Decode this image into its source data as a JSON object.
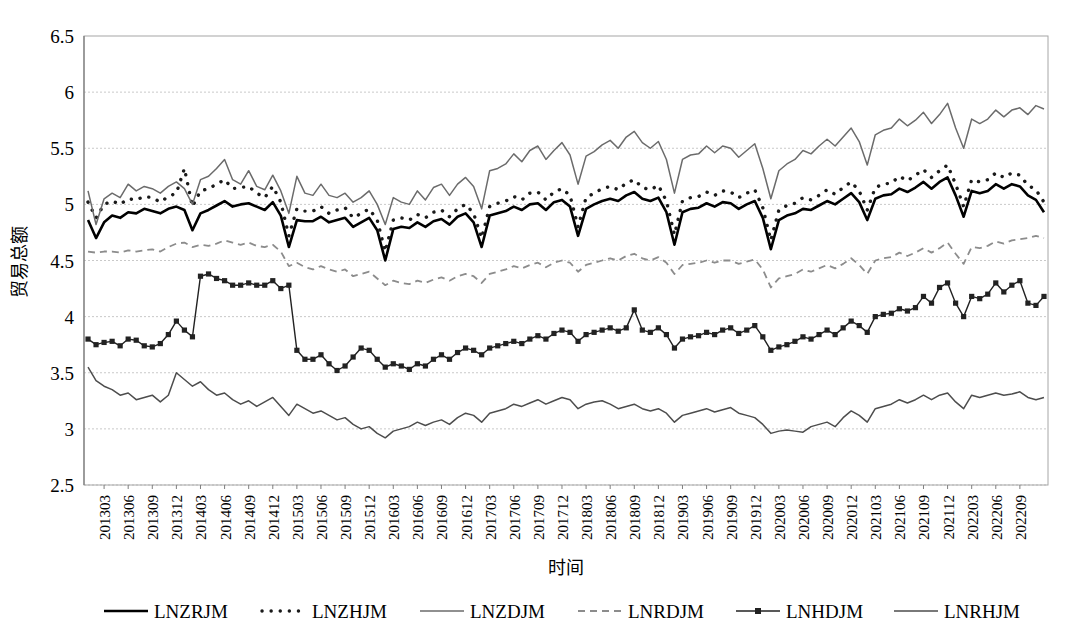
{
  "axes": {
    "y_title": "贸易总额",
    "x_title": "时间",
    "y_ticks": [
      "6.5",
      "6",
      "5.5",
      "5",
      "4.5",
      "4",
      "3.5",
      "3",
      "2.5"
    ],
    "x_ticks": [
      "201303",
      "201306",
      "201309",
      "201312",
      "201403",
      "201406",
      "201409",
      "201412",
      "201503",
      "201506",
      "201509",
      "201512",
      "201603",
      "201606",
      "201609",
      "201612",
      "201703",
      "201706",
      "201709",
      "201712",
      "201803",
      "201806",
      "201809",
      "201812",
      "201903",
      "201906",
      "201909",
      "201912",
      "202003",
      "202006",
      "202009",
      "202012",
      "202103",
      "202106",
      "202109",
      "202112",
      "202203",
      "202206",
      "202209"
    ]
  },
  "legend": {
    "items": [
      {
        "label": "LNZRJM",
        "style": "solid-thick-black",
        "color": "#000000"
      },
      {
        "label": "LNZHJM",
        "style": "dotted-black",
        "color": "#1a1a1a"
      },
      {
        "label": "LNZDJM",
        "style": "solid-thin-gray",
        "color": "#6b6b6b"
      },
      {
        "label": "LNRDJM",
        "style": "dashed-gray",
        "color": "#8c8c8c"
      },
      {
        "label": "LNHDJM",
        "style": "line-square-marker",
        "color": "#222222"
      },
      {
        "label": "LNRHJM",
        "style": "solid-thin-darkgray",
        "color": "#4d4d4d"
      }
    ]
  },
  "chart_data": {
    "type": "line",
    "title": "",
    "xlabel": "时间",
    "ylabel": "贸易总额",
    "ylim": [
      2.5,
      6.5
    ],
    "ytick_step": 0.5,
    "grid": true,
    "legend_position": "bottom",
    "x_start": "201301",
    "x_end": "202212",
    "x_frequency": "monthly",
    "x_tick_interval_months": 3,
    "x": [
      "201301",
      "201302",
      "201303",
      "201304",
      "201305",
      "201306",
      "201307",
      "201308",
      "201309",
      "201310",
      "201311",
      "201312",
      "201401",
      "201402",
      "201403",
      "201404",
      "201405",
      "201406",
      "201407",
      "201408",
      "201409",
      "201410",
      "201411",
      "201412",
      "201501",
      "201502",
      "201503",
      "201504",
      "201505",
      "201506",
      "201507",
      "201508",
      "201509",
      "201510",
      "201511",
      "201512",
      "201601",
      "201602",
      "201603",
      "201604",
      "201605",
      "201606",
      "201607",
      "201608",
      "201609",
      "201610",
      "201611",
      "201612",
      "201701",
      "201702",
      "201703",
      "201704",
      "201705",
      "201706",
      "201707",
      "201708",
      "201709",
      "201710",
      "201711",
      "201712",
      "201801",
      "201802",
      "201803",
      "201804",
      "201805",
      "201806",
      "201807",
      "201808",
      "201809",
      "201810",
      "201811",
      "201812",
      "201901",
      "201902",
      "201903",
      "201904",
      "201905",
      "201906",
      "201907",
      "201908",
      "201909",
      "201910",
      "201911",
      "201912",
      "202001",
      "202002",
      "202003",
      "202004",
      "202005",
      "202006",
      "202007",
      "202008",
      "202009",
      "202010",
      "202011",
      "202012",
      "202101",
      "202102",
      "202103",
      "202104",
      "202105",
      "202106",
      "202107",
      "202108",
      "202109",
      "202110",
      "202111",
      "202112",
      "202201",
      "202202",
      "202203",
      "202204",
      "202205",
      "202206",
      "202207",
      "202208",
      "202209",
      "202210",
      "202211",
      "202212"
    ],
    "series": [
      {
        "name": "LNZRJM",
        "style": "solid-thick-black",
        "values": [
          4.86,
          4.7,
          4.84,
          4.9,
          4.88,
          4.93,
          4.92,
          4.96,
          4.94,
          4.92,
          4.96,
          4.98,
          4.95,
          4.77,
          4.92,
          4.95,
          4.99,
          5.03,
          4.98,
          5.0,
          5.01,
          4.98,
          4.95,
          5.02,
          4.9,
          4.62,
          4.86,
          4.85,
          4.85,
          4.89,
          4.84,
          4.86,
          4.88,
          4.8,
          4.84,
          4.88,
          4.77,
          4.5,
          4.78,
          4.8,
          4.79,
          4.84,
          4.8,
          4.85,
          4.87,
          4.82,
          4.89,
          4.92,
          4.84,
          4.62,
          4.9,
          4.92,
          4.94,
          4.98,
          4.95,
          5.0,
          5.01,
          4.95,
          5.02,
          5.04,
          4.98,
          4.72,
          4.96,
          5.0,
          5.03,
          5.05,
          5.03,
          5.08,
          5.11,
          5.05,
          5.03,
          5.06,
          4.93,
          4.64,
          4.93,
          4.96,
          4.97,
          5.01,
          4.98,
          5.02,
          5.01,
          4.96,
          5.0,
          5.03,
          4.88,
          4.6,
          4.86,
          4.9,
          4.92,
          4.96,
          4.95,
          4.99,
          5.03,
          5.0,
          5.05,
          5.1,
          5.02,
          4.86,
          5.05,
          5.08,
          5.09,
          5.14,
          5.11,
          5.15,
          5.2,
          5.14,
          5.2,
          5.24,
          5.08,
          4.89,
          5.12,
          5.1,
          5.12,
          5.18,
          5.14,
          5.18,
          5.16,
          5.08,
          5.04,
          4.93
        ]
      },
      {
        "name": "LNZHJM",
        "style": "dotted-black",
        "values": [
          5.02,
          4.88,
          5.0,
          5.03,
          5.0,
          5.05,
          5.04,
          5.07,
          5.06,
          5.02,
          5.07,
          5.1,
          5.32,
          4.98,
          5.12,
          5.14,
          5.18,
          5.22,
          5.14,
          5.15,
          5.16,
          5.1,
          5.06,
          5.16,
          5.02,
          4.72,
          4.96,
          4.94,
          4.94,
          4.98,
          4.92,
          4.95,
          4.97,
          4.88,
          4.92,
          4.96,
          4.86,
          4.58,
          4.86,
          4.88,
          4.86,
          4.91,
          4.88,
          4.93,
          4.95,
          4.89,
          4.96,
          5.0,
          4.92,
          4.7,
          4.98,
          5.01,
          5.03,
          5.07,
          5.04,
          5.1,
          5.11,
          5.04,
          5.11,
          5.14,
          5.08,
          4.8,
          5.06,
          5.1,
          5.14,
          5.16,
          5.13,
          5.19,
          5.22,
          5.15,
          5.13,
          5.17,
          5.03,
          4.73,
          5.03,
          5.06,
          5.07,
          5.11,
          5.08,
          5.12,
          5.11,
          5.06,
          5.1,
          5.13,
          4.97,
          4.68,
          4.95,
          4.99,
          5.01,
          5.06,
          5.04,
          5.08,
          5.13,
          5.09,
          5.15,
          5.2,
          5.12,
          4.95,
          5.15,
          5.18,
          5.19,
          5.25,
          5.21,
          5.26,
          5.31,
          5.24,
          5.3,
          5.35,
          5.18,
          4.98,
          5.22,
          5.2,
          5.22,
          5.28,
          5.24,
          5.28,
          5.26,
          5.17,
          5.13,
          5.02
        ]
      },
      {
        "name": "LNZDJM",
        "style": "solid-thin-gray",
        "values": [
          5.12,
          4.82,
          5.05,
          5.1,
          5.06,
          5.18,
          5.12,
          5.16,
          5.14,
          5.1,
          5.16,
          5.2,
          5.14,
          5.0,
          5.22,
          5.25,
          5.32,
          5.4,
          5.22,
          5.18,
          5.3,
          5.16,
          5.13,
          5.26,
          5.12,
          4.92,
          5.25,
          5.1,
          5.08,
          5.18,
          5.08,
          5.06,
          5.1,
          5.02,
          5.06,
          5.12,
          5.0,
          4.82,
          5.06,
          5.02,
          5.0,
          5.12,
          5.04,
          5.15,
          5.18,
          5.08,
          5.18,
          5.24,
          5.16,
          4.96,
          5.3,
          5.32,
          5.36,
          5.45,
          5.38,
          5.48,
          5.52,
          5.4,
          5.48,
          5.55,
          5.44,
          5.18,
          5.43,
          5.47,
          5.53,
          5.57,
          5.5,
          5.6,
          5.65,
          5.55,
          5.5,
          5.56,
          5.4,
          5.1,
          5.4,
          5.44,
          5.45,
          5.52,
          5.46,
          5.52,
          5.5,
          5.42,
          5.48,
          5.54,
          5.32,
          5.05,
          5.3,
          5.36,
          5.4,
          5.48,
          5.45,
          5.52,
          5.58,
          5.52,
          5.6,
          5.68,
          5.56,
          5.35,
          5.62,
          5.66,
          5.68,
          5.76,
          5.7,
          5.75,
          5.82,
          5.72,
          5.8,
          5.9,
          5.68,
          5.5,
          5.76,
          5.72,
          5.76,
          5.84,
          5.78,
          5.84,
          5.86,
          5.8,
          5.88,
          5.85
        ]
      },
      {
        "name": "LNRDJM",
        "style": "dashed-gray",
        "values": [
          4.58,
          4.57,
          4.58,
          4.58,
          4.57,
          4.59,
          4.58,
          4.59,
          4.6,
          4.58,
          4.62,
          4.65,
          4.66,
          4.62,
          4.64,
          4.63,
          4.65,
          4.68,
          4.66,
          4.64,
          4.66,
          4.63,
          4.62,
          4.64,
          4.58,
          4.45,
          4.48,
          4.44,
          4.42,
          4.45,
          4.42,
          4.4,
          4.42,
          4.36,
          4.38,
          4.4,
          4.34,
          4.28,
          4.32,
          4.3,
          4.29,
          4.32,
          4.3,
          4.33,
          4.35,
          4.32,
          4.36,
          4.38,
          4.36,
          4.3,
          4.38,
          4.4,
          4.42,
          4.45,
          4.43,
          4.46,
          4.48,
          4.44,
          4.48,
          4.5,
          4.48,
          4.4,
          4.46,
          4.48,
          4.5,
          4.52,
          4.5,
          4.54,
          4.56,
          4.52,
          4.5,
          4.53,
          4.48,
          4.38,
          4.46,
          4.47,
          4.48,
          4.5,
          4.48,
          4.5,
          4.5,
          4.47,
          4.49,
          4.51,
          4.42,
          4.26,
          4.34,
          4.36,
          4.38,
          4.42,
          4.4,
          4.43,
          4.46,
          4.43,
          4.47,
          4.52,
          4.46,
          4.38,
          4.5,
          4.52,
          4.53,
          4.57,
          4.54,
          4.57,
          4.61,
          4.57,
          4.61,
          4.66,
          4.56,
          4.47,
          4.62,
          4.61,
          4.63,
          4.67,
          4.65,
          4.68,
          4.69,
          4.7,
          4.72,
          4.7
        ]
      },
      {
        "name": "LNHDJM",
        "style": "line-square-marker",
        "values": [
          3.8,
          3.75,
          3.77,
          3.78,
          3.74,
          3.8,
          3.79,
          3.74,
          3.73,
          3.76,
          3.84,
          3.96,
          3.88,
          3.82,
          4.36,
          4.38,
          4.34,
          4.32,
          4.28,
          4.28,
          4.3,
          4.28,
          4.28,
          4.32,
          4.25,
          4.28,
          3.7,
          3.62,
          3.62,
          3.66,
          3.58,
          3.52,
          3.56,
          3.64,
          3.72,
          3.7,
          3.62,
          3.55,
          3.58,
          3.56,
          3.53,
          3.58,
          3.56,
          3.62,
          3.66,
          3.62,
          3.68,
          3.72,
          3.7,
          3.66,
          3.72,
          3.74,
          3.76,
          3.78,
          3.76,
          3.8,
          3.83,
          3.8,
          3.85,
          3.88,
          3.86,
          3.78,
          3.84,
          3.86,
          3.88,
          3.9,
          3.87,
          3.9,
          4.06,
          3.88,
          3.86,
          3.9,
          3.84,
          3.72,
          3.8,
          3.82,
          3.83,
          3.86,
          3.84,
          3.88,
          3.9,
          3.85,
          3.88,
          3.92,
          3.82,
          3.7,
          3.73,
          3.75,
          3.78,
          3.82,
          3.8,
          3.84,
          3.88,
          3.84,
          3.9,
          3.96,
          3.92,
          3.86,
          4.0,
          4.02,
          4.03,
          4.07,
          4.05,
          4.08,
          4.18,
          4.12,
          4.26,
          4.3,
          4.12,
          4.0,
          4.18,
          4.16,
          4.2,
          4.3,
          4.22,
          4.28,
          4.32,
          4.12,
          4.1,
          4.18
        ]
      },
      {
        "name": "LNRHJM",
        "style": "solid-thin-darkgray",
        "values": [
          3.55,
          3.43,
          3.38,
          3.35,
          3.3,
          3.32,
          3.26,
          3.28,
          3.3,
          3.24,
          3.3,
          3.5,
          3.44,
          3.38,
          3.42,
          3.35,
          3.3,
          3.32,
          3.26,
          3.22,
          3.25,
          3.2,
          3.24,
          3.28,
          3.2,
          3.12,
          3.22,
          3.18,
          3.14,
          3.16,
          3.12,
          3.08,
          3.1,
          3.04,
          3.0,
          3.02,
          2.96,
          2.92,
          2.98,
          3.0,
          3.02,
          3.06,
          3.03,
          3.06,
          3.08,
          3.04,
          3.1,
          3.14,
          3.12,
          3.06,
          3.14,
          3.16,
          3.18,
          3.22,
          3.2,
          3.23,
          3.26,
          3.22,
          3.25,
          3.28,
          3.26,
          3.18,
          3.22,
          3.24,
          3.25,
          3.22,
          3.18,
          3.2,
          3.22,
          3.18,
          3.16,
          3.18,
          3.14,
          3.06,
          3.12,
          3.14,
          3.16,
          3.18,
          3.15,
          3.17,
          3.19,
          3.14,
          3.12,
          3.1,
          3.04,
          2.96,
          2.98,
          2.99,
          2.98,
          2.97,
          3.02,
          3.04,
          3.06,
          3.02,
          3.1,
          3.16,
          3.12,
          3.06,
          3.18,
          3.2,
          3.22,
          3.26,
          3.23,
          3.26,
          3.3,
          3.26,
          3.3,
          3.32,
          3.24,
          3.18,
          3.3,
          3.28,
          3.3,
          3.32,
          3.3,
          3.31,
          3.33,
          3.28,
          3.26,
          3.28
        ]
      }
    ]
  }
}
